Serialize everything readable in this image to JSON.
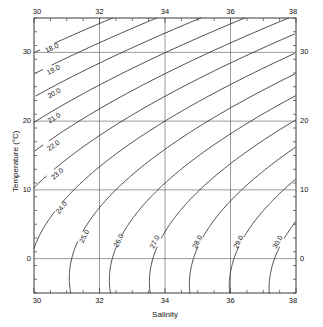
{
  "figure": {
    "kind": "ts-diagram",
    "background": "#ffffff",
    "line_color": "#2b2b2b",
    "grid_color": "#6e6e6e",
    "frame_color": "#3a3a3a"
  },
  "axes": {
    "x_title": "Salinity",
    "y_title": "Temperature (°C)",
    "x_ticks": [
      "30",
      "32",
      "34",
      "36",
      "38"
    ],
    "y_ticks": [
      "0",
      "10",
      "20",
      "30"
    ],
    "x_ticks_top": [
      "30",
      "32",
      "34",
      "36",
      "38"
    ],
    "y_ticks_right": [
      "0",
      "10",
      "20",
      "30"
    ]
  },
  "chart_data": {
    "type": "line",
    "title": "",
    "xlabel": "Salinity",
    "ylabel": "Temperature (°C)",
    "xlim": [
      30,
      38
    ],
    "ylim": [
      -5,
      35
    ],
    "grid": true,
    "legend": "none",
    "x_major_ticks": [
      30,
      32,
      34,
      36,
      38
    ],
    "y_major_ticks": [
      0,
      10,
      20,
      30
    ],
    "x_minor_step": 0.5,
    "y_minor_step": 2,
    "contour_variable": "sigma-t",
    "contour_levels": [
      18.0,
      19.0,
      20.0,
      21.0,
      22.0,
      23.0,
      24.0,
      25.0,
      26.0,
      27.0,
      28.0,
      29.0,
      30.0
    ],
    "contour_labels": [
      "18.0",
      "19.0",
      "20.0",
      "21.0",
      "22.0",
      "23.0",
      "24.0",
      "25.0",
      "26.0",
      "27.0",
      "28.0",
      "29.0",
      "30.0"
    ],
    "label_points": [
      {
        "level": "18.0",
        "s": 30.55,
        "t": 30.6
      },
      {
        "level": "19.0",
        "s": 30.6,
        "t": 27.4
      },
      {
        "level": "20.0",
        "s": 30.62,
        "t": 24.0
      },
      {
        "level": "21.0",
        "s": 30.62,
        "t": 20.4
      },
      {
        "level": "22.0",
        "s": 30.6,
        "t": 16.4
      },
      {
        "level": "23.0",
        "s": 30.72,
        "t": 12.3
      },
      {
        "level": "24.0",
        "s": 30.85,
        "t": 7.4
      },
      {
        "level": "25.0",
        "s": 31.55,
        "t": 3.2
      },
      {
        "level": "26.0",
        "s": 32.6,
        "t": 2.6
      },
      {
        "level": "27.0",
        "s": 33.7,
        "t": 2.4
      },
      {
        "level": "28.0",
        "s": 35.0,
        "t": 2.4
      },
      {
        "level": "29.0",
        "s": 36.25,
        "t": 2.4
      },
      {
        "level": "30.0",
        "s": 37.45,
        "t": 2.4
      }
    ]
  }
}
